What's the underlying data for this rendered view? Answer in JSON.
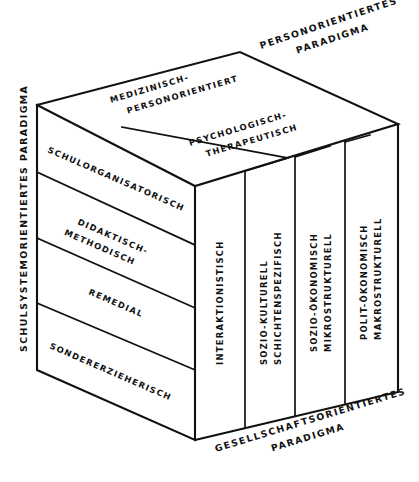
{
  "diagram": {
    "stroke_color": "#111111",
    "background_color": "#ffffff",
    "paradigms": {
      "left_axis": {
        "name": "schulsystemorientiertes-paradigma",
        "label": "SCHULSYSTEMORIENTIERTES PARADIGMA"
      },
      "top_axis": {
        "name": "personorientiertes-paradigma",
        "line1": "PERSONORIENTIERTES",
        "line2": "PARADIGMA"
      },
      "bottom_axis": {
        "name": "gesellschaftsorientiertes-paradigma",
        "line1": "GESELLSCHAFTSORIENTIERTES",
        "line2": "PARADIGMA"
      }
    },
    "side_bands": [
      {
        "line1": "SCHULORGANISATORISCH",
        "line2": ""
      },
      {
        "line1": "DIDAKTISCH-",
        "line2": "METHODISCH"
      },
      {
        "line1": "REMEDIAL",
        "line2": ""
      },
      {
        "line1": "SONDERERZIEHERISCH",
        "line2": ""
      }
    ],
    "top_bands": [
      {
        "line1": "MEDIZINISCH-",
        "line2": "PERSONORIENTIERT"
      },
      {
        "line1": "PSYCHOLOGISCH-",
        "line2": "THERAPEUTISCH"
      }
    ],
    "front_columns": [
      {
        "line1": "INTERAKTIONISTISCH",
        "line2": ""
      },
      {
        "line1": "SOZIO-KULTURELL",
        "line2": "SCHICHTENSPEZIFISCH"
      },
      {
        "line1": "SOZIO-ÖKONOMISCH",
        "line2": "MIKROSTRUKTURELL"
      },
      {
        "line1": "POLIT-ÖKONOMISCH",
        "line2": "MAKROSTRUKTURELL"
      }
    ]
  }
}
